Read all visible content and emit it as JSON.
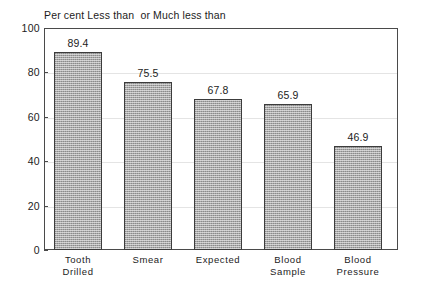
{
  "chart_data": {
    "type": "bar",
    "title": "Per cent Less than  or Much less than",
    "xlabel": "",
    "ylabel": "",
    "ylim": [
      0,
      100
    ],
    "yticks": [
      0,
      20,
      40,
      60,
      80,
      100
    ],
    "ytick_labels": [
      "0",
      "20",
      "40",
      "60",
      "80",
      "100"
    ],
    "grid": true,
    "legend": null,
    "categories": [
      "Tooth\nDrilled",
      "Smear",
      "Expected",
      "Blood\nSample",
      "Blood\nPressure"
    ],
    "values": [
      89.4,
      75.5,
      67.8,
      65.9,
      46.9
    ],
    "value_labels": [
      "89.4",
      "75.5",
      "67.8",
      "65.9",
      "46.9"
    ],
    "bar_color": "#a9a9a9",
    "bar_edge_color": "#3c3c3c",
    "frame_color": "#4a4a4a",
    "grid_color": "#e4e4e4",
    "background": "#ffffff"
  }
}
